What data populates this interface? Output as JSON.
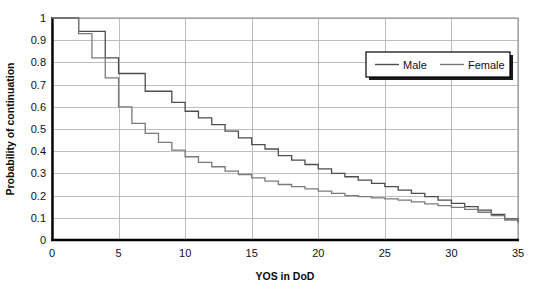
{
  "chart_data": {
    "type": "line",
    "subtype": "step",
    "title": "",
    "xlabel": "YOS in DoD",
    "ylabel": "Probability of continuation",
    "xlim": [
      0,
      35
    ],
    "ylim": [
      0,
      1
    ],
    "xticks": [
      0,
      5,
      10,
      15,
      20,
      25,
      30,
      35
    ],
    "xtick_labels": [
      "0",
      "5",
      "10",
      "15",
      "20",
      "25",
      "30",
      "35"
    ],
    "yticks": [
      0,
      0.1,
      0.2,
      0.3,
      0.4,
      0.5,
      0.6,
      0.7,
      0.8,
      0.9,
      1
    ],
    "ytick_labels": [
      "0",
      "0.1",
      "0.2",
      "0.3",
      "0.4",
      "0.5",
      "0.6",
      "0.7",
      "0.8",
      "0.9",
      "1"
    ],
    "grid": {
      "horizontal": true,
      "vertical": true,
      "color": "#b5b5b5"
    },
    "legend": {
      "position": "top-right",
      "entries": [
        "Male",
        "Female"
      ]
    },
    "x": [
      0,
      1,
      2,
      3,
      4,
      5,
      6,
      7,
      8,
      9,
      10,
      11,
      12,
      13,
      14,
      15,
      16,
      17,
      18,
      19,
      20,
      21,
      22,
      23,
      24,
      25,
      26,
      27,
      28,
      29,
      30,
      31,
      32,
      33,
      34,
      35
    ],
    "series": [
      {
        "name": "Male",
        "color": "#4d4d4d",
        "values": [
          1.0,
          1.0,
          0.94,
          0.94,
          0.82,
          0.75,
          0.75,
          0.67,
          0.67,
          0.62,
          0.58,
          0.55,
          0.52,
          0.49,
          0.46,
          0.43,
          0.41,
          0.38,
          0.36,
          0.34,
          0.32,
          0.3,
          0.285,
          0.27,
          0.255,
          0.24,
          0.225,
          0.21,
          0.195,
          0.18,
          0.165,
          0.15,
          0.135,
          0.115,
          0.095,
          0.08
        ]
      },
      {
        "name": "Female",
        "color": "#7a7a7a",
        "values": [
          1.0,
          1.0,
          0.93,
          0.82,
          0.73,
          0.6,
          0.525,
          0.48,
          0.44,
          0.405,
          0.375,
          0.35,
          0.33,
          0.31,
          0.295,
          0.28,
          0.265,
          0.25,
          0.24,
          0.23,
          0.22,
          0.21,
          0.2,
          0.195,
          0.19,
          0.185,
          0.18,
          0.172,
          0.163,
          0.155,
          0.147,
          0.138,
          0.125,
          0.11,
          0.09,
          0.075
        ]
      }
    ]
  },
  "legend": {
    "male_label": "Male",
    "female_label": "Female"
  },
  "axes": {
    "x_title": "YOS in DoD",
    "y_title": "Probability of continuation"
  }
}
